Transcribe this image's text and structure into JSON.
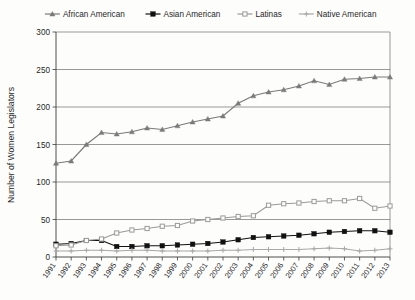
{
  "chart_data": {
    "type": "line",
    "title": "",
    "xlabel": "",
    "ylabel": "Number of Women Legislators",
    "ylim": [
      0,
      300
    ],
    "ytick_values": [
      0,
      50,
      100,
      150,
      200,
      250,
      300
    ],
    "ytick_labels": [
      "0",
      "50",
      "100",
      "150",
      "200",
      "250",
      "300"
    ],
    "grid": true,
    "legend_position": "top",
    "categories": [
      "1991",
      "1992",
      "1993",
      "1994",
      "1995",
      "1996",
      "1997",
      "1998",
      "1999",
      "2000",
      "2001",
      "2002",
      "2003",
      "2004",
      "2005",
      "2006",
      "2007",
      "2008",
      "2009",
      "2010",
      "2011",
      "2012",
      "2013"
    ],
    "series": [
      {
        "name": "African American",
        "marker": "triangle",
        "color": "#7a7a7a",
        "values": [
          125,
          128,
          150,
          166,
          164,
          167,
          172,
          170,
          175,
          180,
          184,
          188,
          205,
          215,
          220,
          223,
          228,
          235,
          230,
          237,
          238,
          240,
          240
        ]
      },
      {
        "name": "Asian American",
        "marker": "square",
        "color": "#111111",
        "values": [
          17,
          18,
          22,
          22,
          14,
          14,
          15,
          15,
          16,
          17,
          18,
          20,
          23,
          26,
          27,
          28,
          29,
          31,
          33,
          34,
          35,
          35,
          33
        ]
      },
      {
        "name": "Latinas",
        "marker": "square-open",
        "color": "#9a9a9a",
        "values": [
          15,
          16,
          22,
          24,
          32,
          36,
          38,
          41,
          42,
          48,
          50,
          52,
          54,
          55,
          69,
          71,
          72,
          74,
          75,
          75,
          78,
          65,
          68
        ]
      },
      {
        "name": "Native American",
        "marker": "plus",
        "color": "#a8a8a8",
        "values": [
          8,
          8,
          9,
          9,
          8,
          9,
          9,
          8,
          8,
          8,
          8,
          9,
          9,
          10,
          10,
          10,
          10,
          11,
          12,
          11,
          8,
          9,
          11
        ]
      }
    ]
  },
  "legend": {
    "items": [
      {
        "label": "African American"
      },
      {
        "label": "Asian American"
      },
      {
        "label": "Latinas"
      },
      {
        "label": "Native American"
      }
    ]
  },
  "axes": {
    "y_title": "Number of Women Legislators"
  }
}
